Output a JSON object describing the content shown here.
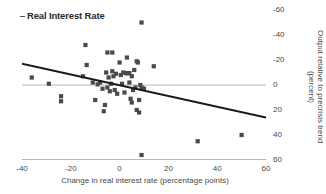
{
  "panel": {
    "title": "Real Interest Rate",
    "title_marker": "dash-marker"
  },
  "axes": {
    "x_label": "Change in real interest rate (percentage points)",
    "y_label_line1": "Output relative to precrisis trend",
    "y_label_line2": "(percent)",
    "x_ticks": [
      "-40",
      "-20",
      "0",
      "20",
      "40",
      "60"
    ],
    "y_ticks": [
      "60",
      "40",
      "20",
      "0",
      "-20",
      "-40",
      "-60"
    ]
  },
  "colors": {
    "marker": "#4a4a4a",
    "trendline": "#1a1a1a",
    "axis": "#6e6e6e",
    "gridline": "#b8b8b8",
    "text": "#4a4a4a"
  },
  "chart_data": {
    "type": "scatter",
    "title": "Real Interest Rate",
    "xlabel": "Change in real interest rate (percentage points)",
    "ylabel": "Output relative to precrisis trend (percent)",
    "xlim": [
      -40,
      60
    ],
    "ylim": [
      -60,
      60
    ],
    "x_ticks": [
      -40,
      -20,
      0,
      20,
      40,
      60
    ],
    "y_ticks": [
      -60,
      -40,
      -20,
      0,
      20,
      40,
      60
    ],
    "grid": false,
    "zero_gridline": true,
    "legend": null,
    "marker": "square",
    "points": [
      [
        -36.0,
        6.0
      ],
      [
        -29.0,
        1.0
      ],
      [
        -24.0,
        -9.0
      ],
      [
        -24.0,
        -13.0
      ],
      [
        -15.0,
        7.0
      ],
      [
        -14.0,
        32.0
      ],
      [
        -13.5,
        16.0
      ],
      [
        -11.0,
        2.0
      ],
      [
        -10.0,
        -12.0
      ],
      [
        -9.0,
        0.5
      ],
      [
        -8.0,
        2.0
      ],
      [
        -7.0,
        -3.0
      ],
      [
        -6.5,
        -21.0
      ],
      [
        -6.0,
        -16.0
      ],
      [
        -5.5,
        10.0
      ],
      [
        -5.0,
        26.0
      ],
      [
        -5.0,
        -2.0
      ],
      [
        -4.5,
        6.0
      ],
      [
        -4.0,
        -5.0
      ],
      [
        -3.5,
        1.0
      ],
      [
        -3.0,
        11.0
      ],
      [
        -3.0,
        26.0
      ],
      [
        -2.5,
        7.0
      ],
      [
        -2.0,
        -4.0
      ],
      [
        -1.5,
        9.0
      ],
      [
        -1.0,
        -7.0
      ],
      [
        0.0,
        18.0
      ],
      [
        0.5,
        8.0
      ],
      [
        1.0,
        1.0
      ],
      [
        1.5,
        10.0
      ],
      [
        2.0,
        -6.0
      ],
      [
        2.5,
        9.5
      ],
      [
        3.0,
        9.5
      ],
      [
        3.0,
        22.0
      ],
      [
        3.5,
        9.5
      ],
      [
        4.0,
        9.5
      ],
      [
        4.0,
        2.0
      ],
      [
        4.5,
        -11.0
      ],
      [
        5.0,
        7.0
      ],
      [
        5.0,
        -14.0
      ],
      [
        5.5,
        -4.0
      ],
      [
        6.0,
        12.0
      ],
      [
        6.5,
        -2.0
      ],
      [
        7.0,
        -20.0
      ],
      [
        7.0,
        19.0
      ],
      [
        7.5,
        18.0
      ],
      [
        8.0,
        -12.0
      ],
      [
        8.0,
        -22.0
      ],
      [
        8.5,
        0.0
      ],
      [
        9.0,
        50.0
      ],
      [
        9.0,
        -2.0
      ],
      [
        9.0,
        -56.0
      ],
      [
        9.5,
        -3.0
      ],
      [
        10.0,
        -3.0
      ],
      [
        14.0,
        15.0
      ],
      [
        32.0,
        -45.0
      ],
      [
        50.0,
        -40.0
      ]
    ],
    "trendline": {
      "x": [
        -40,
        60
      ],
      "y": [
        17.0,
        -26.0
      ],
      "description": "negative linear fit"
    }
  }
}
